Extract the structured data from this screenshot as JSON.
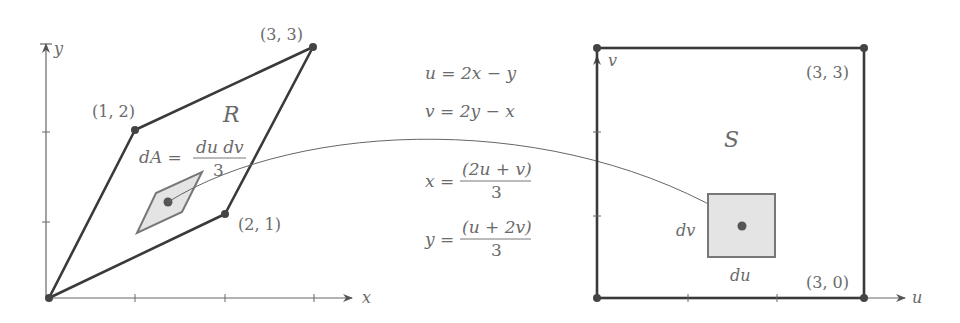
{
  "left_panel": {
    "axis_x_label": "x",
    "axis_y_label": "y",
    "region_label": "R",
    "vertices": [
      {
        "label": "(1, 2)",
        "x": 1,
        "y": 2
      },
      {
        "label": "(2, 1)",
        "x": 2,
        "y": 1
      },
      {
        "label": "(3, 3)",
        "x": 3,
        "y": 3
      }
    ],
    "area_element": {
      "lhs": "dA =",
      "numerator": "du dv",
      "denominator": "3"
    }
  },
  "middle": {
    "eq_u": "u = 2x − y",
    "eq_v": "v = 2y − x",
    "eq_x": {
      "lhs": "x =",
      "numerator": "(2u + v)",
      "denominator": "3"
    },
    "eq_y": {
      "lhs": "y =",
      "numerator": "(u + 2v)",
      "denominator": "3"
    }
  },
  "right_panel": {
    "axis_u_label": "u",
    "axis_v_label": "v",
    "region_label": "S",
    "vertices": [
      {
        "label": "(3, 3)",
        "u": 3,
        "v": 3
      },
      {
        "label": "(3, 0)",
        "u": 3,
        "v": 0
      }
    ],
    "du_label": "du",
    "dv_label": "dv"
  },
  "colors": {
    "line": "#4a4a4a",
    "text": "#6a6a6a",
    "fill": "#e4e4e4"
  }
}
